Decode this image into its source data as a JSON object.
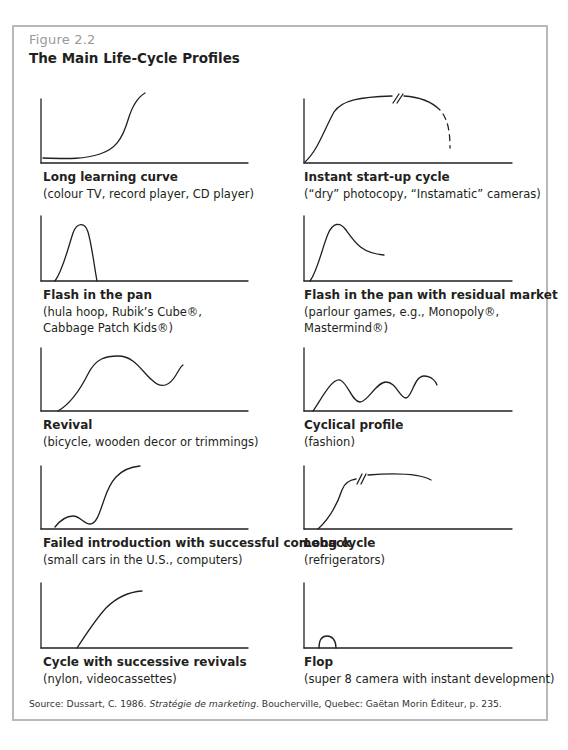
{
  "figure": {
    "label": "Figure 2.2",
    "title": "The Main Life-Cycle Profiles"
  },
  "profiles": [
    {
      "title": "Long learning curve",
      "desc": "(colour TV, record player, CD player)"
    },
    {
      "title": "Instant start-up cycle",
      "desc": "(“dry” photocopy, “Instamatic” cameras)"
    },
    {
      "title": "Flash in the pan",
      "desc": "(hula hoop, Rubik’s Cube®,\nCabbage Patch Kids®)"
    },
    {
      "title": "Flash in the pan with residual market",
      "desc": "(parlour games, e.g., Monopoly®,\nMastermind®)"
    },
    {
      "title": "Revival",
      "desc": "(bicycle, wooden decor or trimmings)"
    },
    {
      "title": "Cyclical profile",
      "desc": "(fashion)"
    },
    {
      "title": "Failed introduction with successful comeback",
      "desc": "(small cars in the U.S., computers)"
    },
    {
      "title": "Long cycle",
      "desc": "(refrigerators)"
    },
    {
      "title": "Cycle with successive revivals",
      "desc": "(nylon, videocassettes)"
    },
    {
      "title": "Flop",
      "desc": "(super 8 camera with instant development)"
    }
  ],
  "source": {
    "prefix": "Source: Dussart, C. 1986. ",
    "book": "Stratégie de marketing",
    "suffix": ". Boucherville, Quebec: Gaëtan Morin Éditeur, p. 235."
  }
}
